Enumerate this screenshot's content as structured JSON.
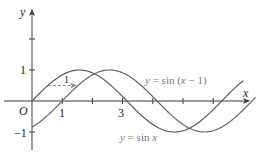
{
  "chart_data": {
    "type": "line",
    "title": "",
    "xlabel": "x",
    "ylabel": "y",
    "origin_label": "O",
    "xlim": [
      0,
      7.1
    ],
    "ylim": [
      -1.5,
      2.8
    ],
    "x_ticks": [
      1,
      2,
      3,
      4,
      5,
      6
    ],
    "x_tick_labels": {
      "1": "1",
      "3": "3"
    },
    "y_ticks": [
      -1,
      1,
      2
    ],
    "y_tick_labels": {
      "-1": "-1",
      "1": "1"
    },
    "grid": false,
    "series": [
      {
        "name": "y = sin x",
        "expr": "sin(x)",
        "color": "#555555",
        "x_range": [
          0,
          7.0
        ]
      },
      {
        "name": "y = sin (x − 1)",
        "expr": "sin(x-1)",
        "color": "#666666",
        "x_range": [
          0,
          7.4
        ]
      }
    ],
    "annotations": [
      {
        "type": "dashed-arrow",
        "from": [
          0.5236,
          0.5
        ],
        "to": [
          1.5236,
          0.5
        ],
        "label": "1",
        "color": "#777777"
      },
      {
        "type": "text",
        "text": "y = sin (x − 1)",
        "at": [
          4.1,
          0.9
        ]
      },
      {
        "type": "text",
        "text": "y = sin x",
        "at": [
          3.0,
          -1.2
        ]
      }
    ]
  },
  "labels": {
    "y_axis": "y",
    "x_axis": "x",
    "origin": "O",
    "tick_1": "1",
    "tick_3": "3",
    "tick_y1": "1",
    "tick_yneg1": "−1",
    "shift_label": "1",
    "curve_shifted": "y = sin (x − 1)",
    "curve_base": "y = sin x"
  },
  "colors": {
    "axis": "#3a3a3a",
    "curve_base": "#5a5a5a",
    "curve_shifted": "#666666",
    "dashed_arrow": "#8a8a8a",
    "curve_label": "#7a7a7a"
  }
}
